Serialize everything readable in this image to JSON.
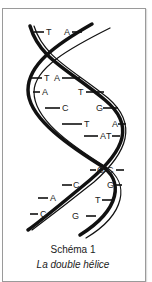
{
  "figure": {
    "title": "Schéma 1",
    "subtitle": "La double hélice",
    "base_pairs": [
      {
        "left": "T",
        "right": "A"
      },
      {
        "left": "T",
        "right": "A"
      },
      {
        "left": "A",
        "right": "T"
      },
      {
        "left": "C",
        "right": "G"
      },
      {
        "left": "T",
        "right": "A"
      },
      {
        "left": "A",
        "right": "T"
      },
      {
        "left": "G",
        "right": "C"
      },
      {
        "left": "C",
        "right": "G"
      },
      {
        "left": "A",
        "right": "T"
      },
      {
        "left": "C",
        "right": "G"
      }
    ]
  }
}
